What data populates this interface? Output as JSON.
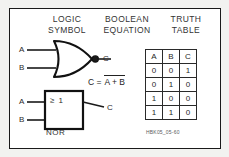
{
  "figure": {
    "border_color": "#1a1a1a",
    "background": "#ffffff",
    "outer_background": "#f2f2f0",
    "caption": "HBK05_05-60"
  },
  "headers": {
    "logic_symbol": {
      "line1": "LOGIC",
      "line2": "SYMBOL"
    },
    "boolean_equation": {
      "line1": "BOOLEAN",
      "line2": "EQUATION"
    },
    "truth_table": {
      "line1": "TRUTH",
      "line2": "TABLE"
    }
  },
  "distinctive_shape_gate": {
    "input_a_label": "A",
    "input_b_label": "B",
    "output_label": "C",
    "type": "nor-gate-distinctive",
    "has_inversion_bubble": true
  },
  "rectangular_shape_gate": {
    "input_a_label": "A",
    "input_b_label": "B",
    "output_label": "C",
    "qualifier": "≥ 1",
    "name": "NOR",
    "type": "nor-gate-iec"
  },
  "equation": {
    "lhs": "C =",
    "expression": "A + B",
    "overbar": true,
    "full_text": "C = A + B (inverted)"
  },
  "truth_table": {
    "columns": [
      "A",
      "B",
      "C"
    ],
    "rows": [
      [
        "0",
        "0",
        "1"
      ],
      [
        "0",
        "1",
        "0"
      ],
      [
        "1",
        "0",
        "0"
      ],
      [
        "1",
        "1",
        "0"
      ]
    ]
  }
}
